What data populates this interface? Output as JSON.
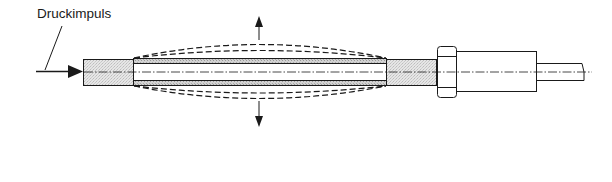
{
  "diagram": {
    "labels": {
      "pressure_pulse": "Druckimpuls"
    },
    "colors": {
      "stroke": "#1a1a1a",
      "fill_gray": "#e2e2e2",
      "wall_gray": "#cfcfcf",
      "background": "#ffffff"
    },
    "components": [
      {
        "name": "inlet-stub",
        "description": "gray stippled inlet fitting"
      },
      {
        "name": "piezo-tube",
        "description": "expanding tube with stippled walls"
      },
      {
        "name": "outlet-stub",
        "description": "gray stippled outlet fitting"
      },
      {
        "name": "hex-nut",
        "description": "hexagonal nut"
      },
      {
        "name": "nozzle-body",
        "description": "cylindrical body"
      },
      {
        "name": "outlet-rod",
        "description": "thin output rod"
      }
    ],
    "annotations": {
      "expansion_arrows": [
        "up",
        "down"
      ],
      "dashed_deformation_curves": 4,
      "input_arrow_direction": "right"
    }
  }
}
